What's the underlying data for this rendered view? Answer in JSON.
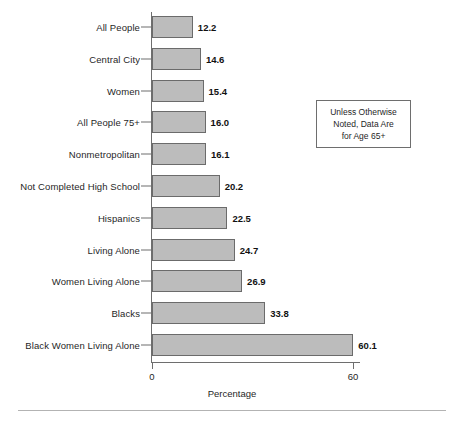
{
  "chart_data": {
    "type": "bar",
    "orientation": "horizontal",
    "title": "",
    "xlabel": "Percentage",
    "ylabel": "",
    "xlim": [
      0,
      60
    ],
    "xticks": [
      0,
      60
    ],
    "xtick_labels": [
      "0",
      "60"
    ],
    "grid": false,
    "legend": null,
    "categories": [
      "All People",
      "Central City",
      "Women",
      "All People 75+",
      "Nonmetropolitan",
      "Not Completed High School",
      "Hispanics",
      "Living Alone",
      "Women Living Alone",
      "Blacks",
      "Black Women Living Alone"
    ],
    "values": [
      12.2,
      14.6,
      15.4,
      16.0,
      16.1,
      20.2,
      22.5,
      24.7,
      26.9,
      33.8,
      60.1
    ],
    "value_labels": [
      "12.2",
      "14.6",
      "15.4",
      "16.0",
      "16.1",
      "20.2",
      "22.5",
      "24.7",
      "26.9",
      "33.8",
      "60.1"
    ],
    "annotations": [
      {
        "name": "age-note",
        "text": "Unless Otherwise Noted, Data Are for Age 65+",
        "lines": [
          "Unless Otherwise",
          "Noted, Data Are",
          "for Age 65+"
        ]
      }
    ],
    "colors": {
      "bar_fill": "#bcbcbc",
      "bar_stroke": "#6b6b6b",
      "axis": "#6e6e6e",
      "text": "#1f1f1f",
      "background": "#ffffff",
      "rule": "#b3b3b3"
    }
  }
}
